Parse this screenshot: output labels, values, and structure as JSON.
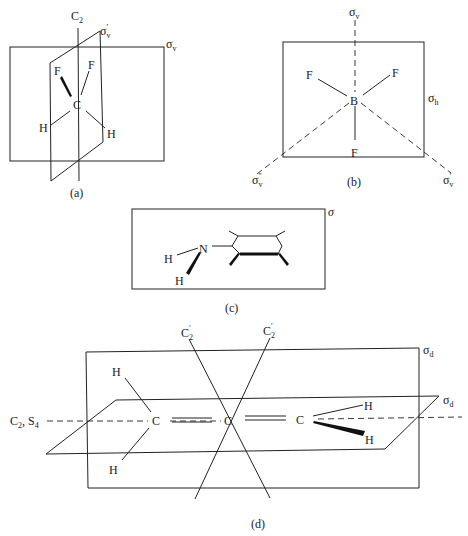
{
  "figure": {
    "panels": [
      {
        "id": "a",
        "caption": "(a)",
        "molecule": "CH2F2",
        "atoms": {
          "center": "C",
          "f1": "F",
          "f2": "F",
          "h1": "H",
          "h2": "H"
        },
        "axis_label": "C",
        "axis_sub": "2",
        "plane1": {
          "sym": "σ",
          "sub": "v",
          "prime": "′"
        },
        "plane2": {
          "sym": "σ",
          "sub": "v"
        }
      },
      {
        "id": "b",
        "caption": "(b)",
        "molecule": "BF3",
        "atoms": {
          "center": "B",
          "f1": "F",
          "f2": "F",
          "f3": "F"
        },
        "plane_v": {
          "sym": "σ",
          "sub": "v"
        },
        "plane_h": {
          "sym": "σ",
          "sub": "h"
        },
        "plane_v2": {
          "sym": "σ",
          "sub": "v",
          "prime": "″"
        },
        "plane_v1": {
          "sym": "σ",
          "sub": "v",
          "prime": "′"
        }
      },
      {
        "id": "c",
        "caption": "(c)",
        "molecule": "aniline-like",
        "atoms": {
          "n": "N",
          "h1": "H",
          "h2": "H"
        },
        "plane": {
          "sym": "σ"
        }
      },
      {
        "id": "d",
        "caption": "(d)",
        "molecule": "allene",
        "atoms": {
          "c1": "C",
          "c2": "C",
          "c3": "C",
          "h1": "H",
          "h2": "H",
          "h3": "H",
          "h4": "H"
        },
        "axis_label": {
          "c": "C",
          "c_sub": "2",
          "sep": ", ",
          "s": "S",
          "s_sub": "4"
        },
        "c2prime_left": {
          "sym": "C",
          "sub": "2",
          "prime": "′"
        },
        "c2prime_right": {
          "sym": "C",
          "sub": "2",
          "prime": "′"
        },
        "plane_d1": {
          "sym": "σ",
          "sub": "d"
        },
        "plane_d2": {
          "sym": "σ",
          "sub": "d"
        }
      }
    ]
  }
}
